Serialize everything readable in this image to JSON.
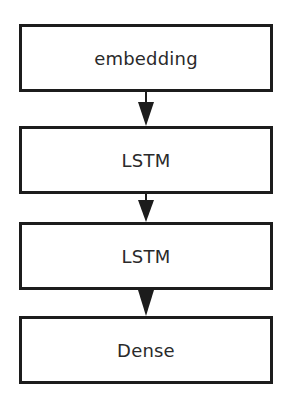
{
  "diagram": {
    "type": "flowchart",
    "direction": "top-to-bottom",
    "nodes": [
      {
        "id": "n1",
        "label": "embedding"
      },
      {
        "id": "n2",
        "label": "LSTM"
      },
      {
        "id": "n3",
        "label": "LSTM"
      },
      {
        "id": "n4",
        "label": "Dense"
      }
    ],
    "edges": [
      {
        "from": "n1",
        "to": "n2"
      },
      {
        "from": "n2",
        "to": "n3"
      },
      {
        "from": "n3",
        "to": "n4"
      }
    ],
    "colors": {
      "border": "#1c1c1c",
      "text": "#2a2a2a",
      "arrow": "#1c1c1c",
      "background": "#ffffff"
    }
  }
}
